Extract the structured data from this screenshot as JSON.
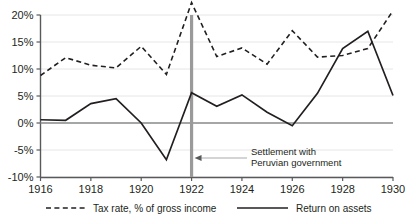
{
  "chart_data": {
    "type": "line",
    "title": "",
    "xlabel": "",
    "ylabel": "",
    "x": [
      1916,
      1917,
      1918,
      1919,
      1920,
      1921,
      1922,
      1923,
      1924,
      1925,
      1926,
      1927,
      1928,
      1929,
      1930
    ],
    "xlim": [
      1916,
      1930
    ],
    "ylim": [
      -10,
      20
    ],
    "ytick_values": [
      20,
      15,
      10,
      5,
      0,
      -5,
      -10
    ],
    "ytick_labels": [
      "20%",
      "15%",
      "10%",
      "5%",
      "0%",
      "-5%",
      "-10%"
    ],
    "xtick_values": [
      1916,
      1918,
      1920,
      1922,
      1924,
      1926,
      1928,
      1930
    ],
    "xtick_labels": [
      "1916",
      "1918",
      "1920",
      "1922",
      "1924",
      "1926",
      "1928",
      "1930"
    ],
    "grid": true,
    "legend_position": "bottom",
    "series": [
      {
        "name": "Tax rate, % of gross income",
        "style": "dashed",
        "color": "#231f20",
        "values": [
          8.8,
          12.1,
          10.7,
          10.2,
          14.2,
          9.0,
          22.3,
          12.3,
          13.9,
          10.9,
          17.1,
          12.2,
          12.5,
          13.8,
          20.8
        ]
      },
      {
        "name": "Return on assets",
        "style": "solid",
        "color": "#231f20",
        "values": [
          0.6,
          0.5,
          3.6,
          4.5,
          0.0,
          -6.8,
          5.6,
          3.1,
          5.2,
          2.0,
          -0.5,
          5.5,
          13.8,
          17.0,
          5.1
        ]
      }
    ],
    "annotations": [
      {
        "name": "settlement-marker",
        "text_line1": "Settlement with",
        "text_line2": "Peruvian government",
        "x": 1922,
        "type": "vertical-line-with-arrow",
        "color": "#9a9a9a"
      }
    ]
  },
  "legend": {
    "items": [
      {
        "label": "Tax rate, % of gross income",
        "style": "dashed"
      },
      {
        "label": "Return on assets",
        "style": "solid"
      }
    ]
  },
  "colors": {
    "line": "#231f20",
    "grid": "#e6e6e6",
    "axis": "#58595b",
    "event": "#9a9a9a",
    "background": "#ffffff"
  }
}
